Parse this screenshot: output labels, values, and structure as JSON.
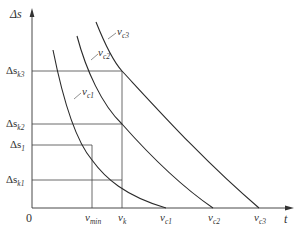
{
  "diagram": {
    "type": "curve-family",
    "axes": {
      "y_label": {
        "symbol": "Δs",
        "full": "Δs"
      },
      "x_label": {
        "symbol": "t",
        "full": "t"
      },
      "origin_label": "0"
    },
    "y_ticks": [
      {
        "id": "ds_k3",
        "base": "Δs",
        "sub": "k3",
        "y": 71
      },
      {
        "id": "ds_k2",
        "base": "Δs",
        "sub": "k2",
        "y": 124
      },
      {
        "id": "ds_1",
        "base": "Δs",
        "sub": "1",
        "y": 145
      },
      {
        "id": "ds_k1",
        "base": "Δs",
        "sub": "k1",
        "y": 180
      }
    ],
    "x_ticks": [
      {
        "id": "v_min",
        "base": "v",
        "sub": "min",
        "x": 92
      },
      {
        "id": "v_k",
        "base": "v",
        "sub": "k",
        "x": 122
      },
      {
        "id": "v_c1",
        "base": "v",
        "sub": "c1",
        "x": 166
      },
      {
        "id": "v_c2",
        "base": "v",
        "sub": "c2",
        "x": 213
      },
      {
        "id": "v_c3",
        "base": "v",
        "sub": "c3",
        "x": 259
      }
    ],
    "curves": [
      {
        "id": "vc1",
        "label_base": "v",
        "label_sub": "c1"
      },
      {
        "id": "vc2",
        "label_base": "v",
        "label_sub": "c2"
      },
      {
        "id": "vc3",
        "label_base": "v",
        "label_sub": "c3"
      }
    ],
    "caption": "",
    "colors": {
      "line": "#333333",
      "background": "#ffffff"
    }
  }
}
